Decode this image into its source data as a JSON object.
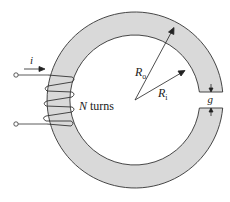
{
  "diagram": {
    "colors": {
      "core_fill": "#d9d9d9",
      "stroke": "#333333",
      "background": "#ffffff"
    },
    "labels": {
      "current": "i",
      "turns_var": "N",
      "turns_text": " turns",
      "outer_radius": "R",
      "outer_radius_sub": "o",
      "inner_radius": "R",
      "inner_radius_sub": "i",
      "gap": "g"
    }
  }
}
